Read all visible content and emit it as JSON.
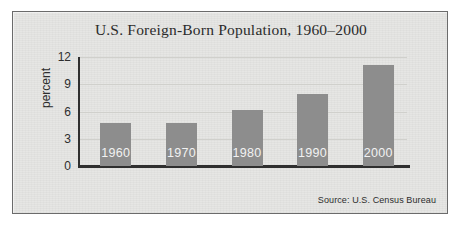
{
  "chart_data": {
    "type": "bar",
    "title": "U.S. Foreign-Born Population, 1960–2000",
    "xlabel": "",
    "ylabel": "percent",
    "categories": [
      "1960",
      "1970",
      "1980",
      "1990",
      "2000"
    ],
    "values": [
      4.7,
      4.7,
      6.2,
      7.9,
      11.1
    ],
    "bar_labels": [
      "1960",
      "1970",
      "1980",
      "1990",
      "2000"
    ],
    "ylim": [
      0,
      12
    ],
    "yticks": [
      12,
      9,
      6,
      3,
      0
    ],
    "ytick_labels": [
      "12",
      "9",
      "6",
      "3",
      "0"
    ],
    "grid": true,
    "legend": "none",
    "annotations": [
      "Source: U.S. Census Bureau"
    ],
    "colors": {
      "bar_fill": "#8d8d8d",
      "bar_label_text": "#f2f2f2",
      "axis": "#2f2f2f",
      "gridline": "#d0d0cc",
      "panel_background": "#e6e6e4",
      "panel_border": "#6b6b6b",
      "title_text": "#2b2b2b",
      "page_background": "#ffffff"
    }
  },
  "figure": {
    "title": "U.S. Foreign-Born Population, 1960–2000",
    "axis": {
      "y_label": "percent",
      "y_ticks": [
        {
          "label": "12",
          "value": 12
        },
        {
          "label": "9",
          "value": 9
        },
        {
          "label": "6",
          "value": 6
        },
        {
          "label": "3",
          "value": 3
        },
        {
          "label": "0",
          "value": 0
        }
      ]
    },
    "bars": [
      {
        "label": "1960",
        "value": 4.7
      },
      {
        "label": "1970",
        "value": 4.7
      },
      {
        "label": "1980",
        "value": 6.2
      },
      {
        "label": "1990",
        "value": 7.9
      },
      {
        "label": "2000",
        "value": 11.1
      }
    ],
    "source": "Source: U.S. Census Bureau"
  }
}
